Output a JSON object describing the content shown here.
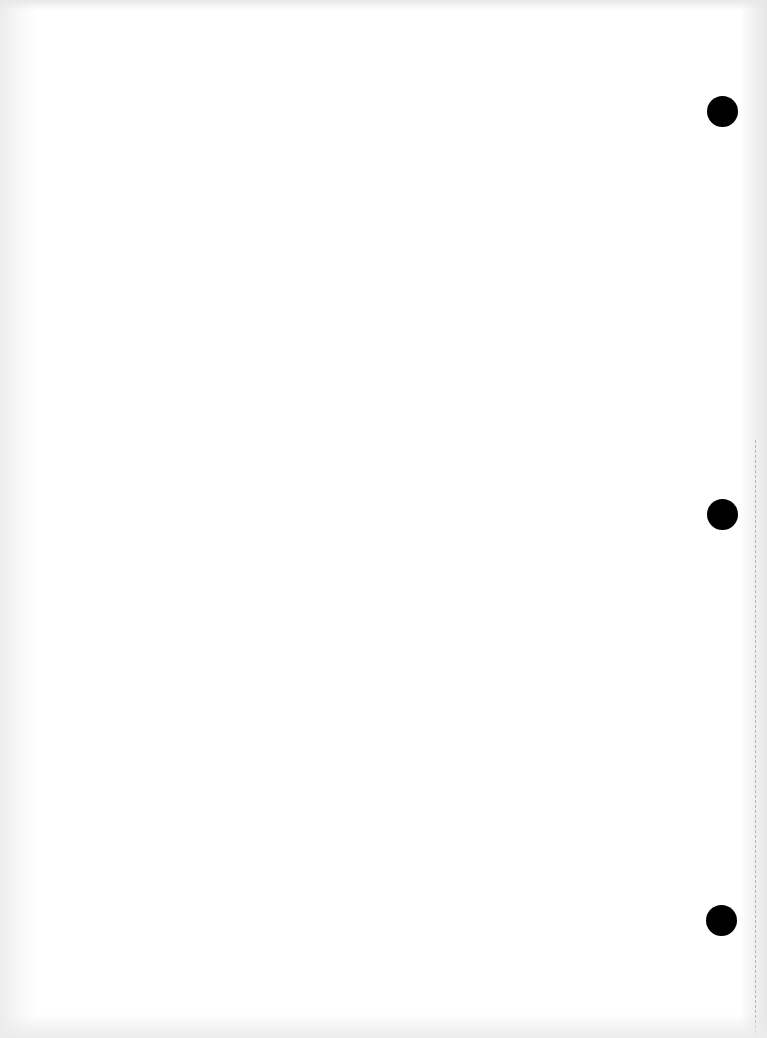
{
  "document": {
    "type": "blank scanned sheet",
    "text": "",
    "colors": {
      "paper": "#ffffff",
      "hole": "#000000",
      "edge_shadow": "#e6e6e6"
    },
    "punch_holes": [
      {
        "position": "top",
        "cx": 723,
        "cy": 112
      },
      {
        "position": "middle",
        "cx": 723,
        "cy": 515
      },
      {
        "position": "bottom",
        "cx": 722,
        "cy": 921
      }
    ]
  }
}
